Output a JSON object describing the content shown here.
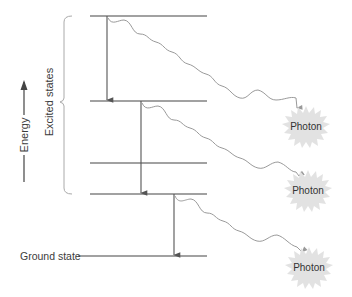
{
  "axis": {
    "label": "Energy"
  },
  "bracket": {
    "label": "Excited states"
  },
  "levels": [
    {
      "name": "excited-4",
      "y": 16
    },
    {
      "name": "excited-3",
      "y": 101
    },
    {
      "name": "excited-2",
      "y": 163
    },
    {
      "name": "excited-1",
      "y": 194
    },
    {
      "name": "ground",
      "y": 256,
      "label": "Ground state"
    }
  ],
  "transitions": [
    {
      "x": 107,
      "from": 16,
      "to": 101
    },
    {
      "x": 141,
      "from": 101,
      "to": 194
    },
    {
      "x": 174,
      "from": 194,
      "to": 256
    }
  ],
  "photons": [
    {
      "label": "Photon",
      "cx": 306,
      "cy": 126
    },
    {
      "label": "Photon",
      "cx": 308,
      "cy": 190
    },
    {
      "label": "Photon",
      "cx": 309,
      "cy": 267
    }
  ],
  "colors": {
    "line": "#444444",
    "arrow": "#555555",
    "wave": "#9a9a9a",
    "burst": "#e2e2e2",
    "text": "#3c3c3c"
  }
}
